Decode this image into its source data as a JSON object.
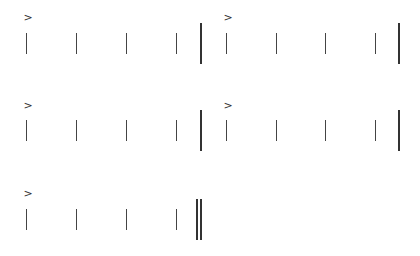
{
  "notation": {
    "accent_glyph": ">",
    "stem_color": "#444444",
    "barline_color": "#333333",
    "systems": [
      {
        "top": 12,
        "measures": [
          {
            "accent": ">",
            "accent_on_beat": 1,
            "beats": 4,
            "stems_x": [
              26,
              76,
              126,
              176
            ],
            "barline_x": 200,
            "barline": "single"
          },
          {
            "accent": ">",
            "accent_on_beat": 1,
            "beats": 4,
            "stems_x": [
              226,
              276,
              325,
              375
            ],
            "barline_x": 398,
            "barline": "single"
          }
        ]
      },
      {
        "top": 100,
        "measures": [
          {
            "accent": ">",
            "accent_on_beat": 1,
            "beats": 4,
            "stems_x": [
              26,
              76,
              126,
              176
            ],
            "barline_x": 200,
            "barline": "single"
          },
          {
            "accent": ">",
            "accent_on_beat": 1,
            "beats": 4,
            "stems_x": [
              226,
              276,
              325,
              375
            ],
            "barline_x": 398,
            "barline": "single"
          }
        ]
      },
      {
        "top": 188,
        "measures": [
          {
            "accent": ">",
            "accent_on_beat": 1,
            "beats": 4,
            "stems_x": [
              26,
              76,
              126,
              176
            ],
            "barline_x": 196,
            "barline": "final-double"
          }
        ]
      }
    ]
  }
}
